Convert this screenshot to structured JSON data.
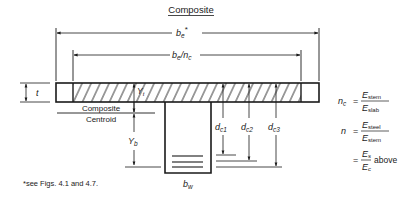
{
  "title": "Composite",
  "dimensions": {
    "effective_width": "b",
    "effective_width_sub": "e",
    "effective_width_mark": "*",
    "transformed_width": "b",
    "transformed_width_sub": "e",
    "transformed_width_div": "/n",
    "transformed_width_div_sub": "c",
    "slab_thickness": "t",
    "y_top": "Y",
    "y_top_sub": "t",
    "y_bottom": "Y",
    "y_bottom_sub": "b",
    "web_width": "b",
    "web_width_sub": "w",
    "depths": [
      {
        "label": "d",
        "sub": "c1"
      },
      {
        "label": "d",
        "sub": "c2"
      },
      {
        "label": "d",
        "sub": "c3"
      }
    ]
  },
  "centroid_label": {
    "line1": "Composite",
    "line2": "Centroid"
  },
  "equations": {
    "nc_lhs": "n",
    "nc_lhs_sub": "c",
    "nc_eq": "=",
    "nc_num": "E",
    "nc_num_sub": "stem",
    "nc_den": "E",
    "nc_den_sub": "slab",
    "n_lhs": "n",
    "n_eq": "=",
    "n_num": "E",
    "n_num_sub": "steel",
    "n_den": "E",
    "n_den_sub": "stem",
    "alt_eq": "=",
    "alt_num": "E",
    "alt_num_sub": "s",
    "alt_den": "E",
    "alt_den_sub": "c",
    "alt_suffix": "above"
  },
  "footnote": "*see Figs. 4.1 and 4.7."
}
